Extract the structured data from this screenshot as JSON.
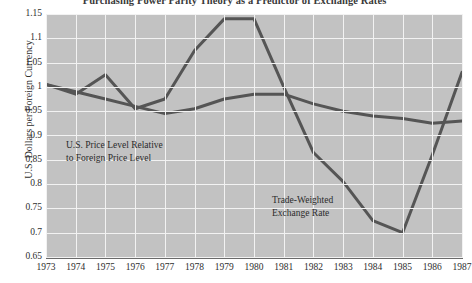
{
  "chart_data": {
    "type": "line",
    "title": "Purchasing Power Parity Theory as a Predictor of Exchange Rates",
    "xlabel": "",
    "ylabel": "U.S. Dollars per Foreign Currency",
    "xlim": [
      1973,
      1987
    ],
    "ylim": [
      0.65,
      1.15
    ],
    "grid": true,
    "legend_position": "inline-annotations",
    "x": [
      1973,
      1974,
      1975,
      1976,
      1977,
      1978,
      1979,
      1980,
      1981,
      1982,
      1983,
      1984,
      1985,
      1986,
      1987
    ],
    "xtick_labels": [
      "1973",
      "1974",
      "1975",
      "1976",
      "1977",
      "1978",
      "1979",
      "1980",
      "1981",
      "1982",
      "1983",
      "1984",
      "1985",
      "1986",
      "1987"
    ],
    "ytick_labels": [
      "1.15",
      "1.1",
      "1.05",
      "1",
      "0.95",
      "0.9",
      "0.85",
      "0.8",
      "0.75",
      "0.7",
      "0.65"
    ],
    "ytick_values": [
      1.15,
      1.1,
      1.05,
      1.0,
      0.95,
      0.9,
      0.85,
      0.8,
      0.75,
      0.7,
      0.65
    ],
    "series": [
      {
        "name": "Trade-Weighted Exchange Rate",
        "label_text": "Trade-Weighted\nExchange Rate",
        "color": "#555555",
        "values": [
          1.005,
          0.985,
          1.025,
          0.955,
          0.975,
          1.075,
          1.14,
          1.14,
          1.0,
          0.865,
          0.805,
          0.725,
          0.7,
          0.86,
          1.03
        ]
      },
      {
        "name": "U.S. Price Level Relative to Foreign Price Level",
        "label_text": "U.S. Price Level Relative\nto Foreign Price Level",
        "color": "#555555",
        "values": [
          1.005,
          0.99,
          0.975,
          0.96,
          0.945,
          0.955,
          0.975,
          0.985,
          0.985,
          0.965,
          0.95,
          0.94,
          0.935,
          0.925,
          0.93
        ]
      }
    ]
  },
  "axes": {
    "y_axis_title": "U.S. Dollars per Foreign Currency"
  },
  "colors": {
    "plot_background": "#c2c2c2",
    "gridline": "#f2f2f2",
    "line": "#555555",
    "text": "#2e2e2e",
    "page_background": "#ffffff"
  }
}
